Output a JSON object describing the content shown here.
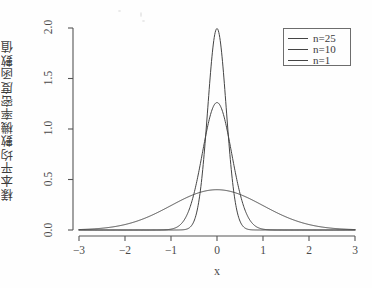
{
  "chart_data": {
    "type": "line",
    "title": "",
    "subtitle": "",
    "xlabel": "x",
    "ylabel": "樣本平均數機率密度函數值",
    "xlim": [
      -3,
      3
    ],
    "ylim": [
      0.0,
      2.0
    ],
    "xticks": [
      -3,
      -2,
      -1,
      0,
      1,
      2,
      3
    ],
    "xtick_labels": [
      "−3",
      "−2",
      "−1",
      "0",
      "1",
      "2",
      "3"
    ],
    "yticks": [
      0.0,
      0.5,
      1.0,
      1.5,
      2.0
    ],
    "ytick_labels": [
      "0.0",
      "0.5",
      "1.0",
      "1.5",
      "2.0"
    ],
    "grid": false,
    "legend_position": "top-right",
    "legend_entries": [
      "n=25",
      "n=10",
      "n=1"
    ],
    "series": [
      {
        "name": "n=25",
        "distribution": "normal",
        "mean": 0,
        "sd": 0.2,
        "peak": 1.9947,
        "color": "#444444",
        "x": [
          -3.0,
          -2.5,
          -2.0,
          -1.5,
          -1.0,
          -0.8,
          -0.6,
          -0.5,
          -0.4,
          -0.3,
          -0.2,
          -0.1,
          0.0,
          0.1,
          0.2,
          0.3,
          0.4,
          0.5,
          0.6,
          0.8,
          1.0,
          1.5,
          2.0,
          2.5,
          3.0
        ],
        "values": [
          0.0,
          0.0,
          0.0,
          0.0,
          0.0,
          0.0001,
          0.0111,
          0.0438,
          0.135,
          0.3247,
          0.6049,
          0.878,
          1.9947,
          0.878,
          0.6049,
          0.3247,
          0.135,
          0.0438,
          0.0111,
          0.0001,
          0.0,
          0.0,
          0.0,
          0.0,
          0.0
        ]
      },
      {
        "name": "n=10",
        "distribution": "normal",
        "mean": 0,
        "sd": 0.3162,
        "peak": 1.2616,
        "color": "#444444",
        "x": [
          -3.0,
          -2.5,
          -2.0,
          -1.5,
          -1.2,
          -1.0,
          -0.8,
          -0.6,
          -0.4,
          -0.2,
          0.0,
          0.2,
          0.4,
          0.6,
          0.8,
          1.0,
          1.2,
          1.5,
          2.0,
          2.5,
          3.0
        ],
        "values": [
          0.0,
          0.0,
          0.0,
          0.0002,
          0.0028,
          0.017,
          0.0726,
          0.2204,
          0.4776,
          0.7365,
          1.2616,
          0.7365,
          0.4776,
          0.2204,
          0.0726,
          0.017,
          0.0028,
          0.0002,
          0.0,
          0.0,
          0.0
        ]
      },
      {
        "name": "n=1",
        "distribution": "normal",
        "mean": 0,
        "sd": 1.0,
        "peak": 0.3989,
        "color": "#444444",
        "x": [
          -3.0,
          -2.5,
          -2.0,
          -1.5,
          -1.0,
          -0.5,
          0.0,
          0.5,
          1.0,
          1.5,
          2.0,
          2.5,
          3.0
        ],
        "values": [
          0.0044,
          0.0175,
          0.054,
          0.1295,
          0.242,
          0.3521,
          0.3989,
          0.3521,
          0.242,
          0.1295,
          0.054,
          0.0175,
          0.0044
        ]
      }
    ]
  },
  "axes": {
    "x_axis_label": "x",
    "y_axis_label": "樣本平均數機率密度函數值"
  },
  "legend": {
    "items": [
      {
        "label": "n=25"
      },
      {
        "label": "n=10"
      },
      {
        "label": "n=1"
      }
    ]
  },
  "xticks": {
    "t0": "−3",
    "t1": "−2",
    "t2": "−1",
    "t3": "0",
    "t4": "1",
    "t5": "2",
    "t6": "3"
  },
  "yticks": {
    "t0": "0.0",
    "t1": "0.5",
    "t2": "1.0",
    "t3": "1.5",
    "t4": "2.0"
  }
}
